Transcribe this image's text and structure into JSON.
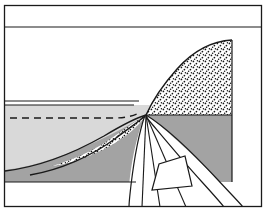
{
  "figure": {
    "kind": "line-drawing",
    "width": 268,
    "height": 213,
    "background_color": "#ffffff",
    "stroke_color": "#1a1a1a"
  },
  "frame": {
    "outer_border": {
      "x": 4,
      "y": 5,
      "width": 258,
      "height": 202,
      "stroke_width": 1.3
    },
    "top_rule": {
      "x1": 4,
      "y1": 27,
      "x2": 262,
      "y2": 27,
      "stroke_width": 1.2
    }
  },
  "layers": [
    {
      "name": "sky-void-upper",
      "label": "upper void",
      "fill": "#ffffff",
      "description": "blank region above the upper horizon line"
    },
    {
      "name": "light-gray-layer",
      "label": "light gray stratum",
      "fill": "#d9d9d9",
      "top_y": 105,
      "left_x": 5,
      "description": "light gray unit bounded above by a double horizon rule"
    },
    {
      "name": "dark-gray-layer",
      "label": "dark gray stratum",
      "fill": "#a3a3a3",
      "bottom_y": 182,
      "right_x": 232,
      "description": "darker gray basement unit below the curved contact"
    },
    {
      "name": "stipple-wedge",
      "label": "stippled wedge",
      "fill": "#ffffff",
      "pattern": "stipple-dots",
      "dot_color": "#141414",
      "apex_x": 145,
      "apex_y": 116,
      "crest_x": 232,
      "crest_y": 40,
      "description": "stippled sedimentary wedge rising to the right, truncated by a vertical edge"
    },
    {
      "name": "lower-white-base",
      "label": "lower white base",
      "fill": "#ffffff",
      "top_y": 182,
      "description": "white band beneath the dark gray stratum"
    }
  ],
  "horizons": [
    {
      "name": "upper-horizon-rule-a",
      "type": "solid",
      "y": 101,
      "x1": 5,
      "x2": 140,
      "stroke_width": 1.1
    },
    {
      "name": "upper-horizon-rule-b",
      "type": "solid",
      "y": 105,
      "x1": 5,
      "x2": 140,
      "stroke_width": 1.1
    },
    {
      "name": "water-table-dashed",
      "type": "dashed",
      "y": 118,
      "x1": 10,
      "x2": 120,
      "dash_pattern": "7 5",
      "stroke_width": 1.3,
      "description": "dashed sub-horizontal marker inside the light gray unit"
    },
    {
      "name": "basal-contact-rule",
      "type": "solid",
      "y": 182,
      "x1": 5,
      "x2": 140,
      "stroke_width": 1.1
    }
  ],
  "curves": [
    {
      "name": "wedge-upper-contact",
      "description": "concave-up curve sweeping from lower-left to the crest of the stippled wedge",
      "stroke_width": 1.4
    },
    {
      "name": "wedge-lower-contact",
      "description": "curve separating the stippled wedge from the dark gray stratum",
      "stroke_width": 1.4
    },
    {
      "name": "light-dark-contact",
      "description": "curved boundary between light gray and dark gray units",
      "stroke_width": 1.4
    },
    {
      "name": "fan-arc-outer",
      "description": "long outer arc sweeping from the apex to the lower-right corner",
      "stroke_width": 1.2
    },
    {
      "name": "fan-arc-inner",
      "description": "inner arc nested inside the outer arc",
      "stroke_width": 1.2
    }
  ],
  "fan": {
    "name": "radiating-fan",
    "apex": {
      "x": 146,
      "y": 115
    },
    "description": "white fan of straight rays radiating downward from the apex",
    "rays": [
      {
        "name": "ray-1",
        "to_x": 133,
        "to_y": 207
      },
      {
        "name": "ray-2",
        "to_x": 148,
        "to_y": 207
      },
      {
        "name": "ray-3",
        "to_x": 176,
        "to_y": 207
      },
      {
        "name": "ray-4",
        "to_x": 205,
        "to_y": 207
      }
    ]
  },
  "inset_block": {
    "name": "quadrilateral-block",
    "description": "small white quadrilateral outline in the lower-central area",
    "points": "152,190 159,164 185,156 192,186",
    "stroke_width": 1.2,
    "fill": "#ffffff"
  },
  "stipple": {
    "name": "stipple-pattern",
    "dot_radius": 0.85,
    "spacing": 6,
    "color": "#141414"
  }
}
